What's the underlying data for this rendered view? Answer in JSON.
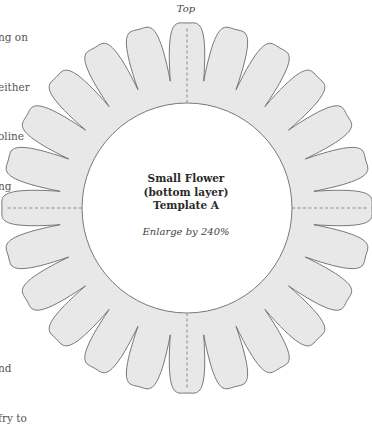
{
  "side_text": {
    "top_lines": [
      "ng on",
      "either",
      "oline",
      "ng"
    ],
    "bottom_lines": [
      "nd",
      "fry to"
    ]
  },
  "template": {
    "top_label": "Top",
    "title_lines": [
      "Small Flower",
      "(bottom layer)",
      "Template A"
    ],
    "instruction": "Enlarge by 240%"
  },
  "flower": {
    "petal_count": 24,
    "center": [
      187,
      208
    ],
    "inner_radius": 105,
    "valley_radius": 128,
    "tip_radius": 185,
    "fill": "#e8e8e8",
    "stroke": "#6a6a6a",
    "dash_color": "#8a8a8a",
    "dashed_guides": [
      "top",
      "right",
      "bottom",
      "left"
    ]
  }
}
